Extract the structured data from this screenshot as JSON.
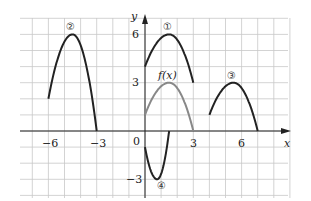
{
  "chart_data": {
    "type": "line",
    "title": "",
    "xlabel": "x",
    "ylabel": "y",
    "x_ticks": [
      "-6",
      "-3",
      "0",
      "3",
      "6"
    ],
    "y_ticks": [
      "6",
      "3",
      "-3"
    ],
    "xlim": [
      -7,
      9
    ],
    "ylim": [
      -4,
      7
    ],
    "grid": true,
    "series": [
      {
        "name": "f(x)",
        "label": "f(x)",
        "color": "#888888",
        "points": [
          [
            0,
            1
          ],
          [
            1.5,
            3
          ],
          [
            3,
            0
          ]
        ]
      },
      {
        "name": "1",
        "label": "①",
        "color": "#222222",
        "points": [
          [
            0,
            4
          ],
          [
            1.5,
            6
          ],
          [
            3,
            3
          ]
        ]
      },
      {
        "name": "2",
        "label": "②",
        "color": "#222222",
        "points": [
          [
            -6,
            2
          ],
          [
            -4.5,
            6
          ],
          [
            -3,
            0
          ]
        ]
      },
      {
        "name": "3",
        "label": "③",
        "color": "#222222",
        "points": [
          [
            4,
            1
          ],
          [
            5.5,
            3
          ],
          [
            7,
            0
          ]
        ]
      },
      {
        "name": "4",
        "label": "④",
        "color": "#222222",
        "points": [
          [
            0,
            -1
          ],
          [
            0.75,
            -3
          ],
          [
            1.5,
            0
          ]
        ]
      }
    ]
  },
  "labels": {
    "x_axis": "x",
    "y_axis": "y",
    "tick_neg6": "−6",
    "tick_neg3": "−3",
    "origin": "0",
    "tick_3": "3",
    "tick_6": "6",
    "ytick_6": "6",
    "ytick_3": "3",
    "ytick_neg3": "−3",
    "fx": "f(x)",
    "c1": "①",
    "c2": "②",
    "c3": "③",
    "c4": "④"
  }
}
